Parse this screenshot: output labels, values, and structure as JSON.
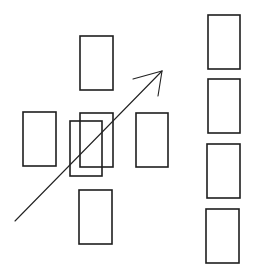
{
  "diagram": {
    "background": "#ffffff",
    "stroke_color": "#1e1e1e",
    "cluster": {
      "rects": [
        {
          "id": "top",
          "x": 80,
          "y": 36,
          "w": 33,
          "h": 54
        },
        {
          "id": "left",
          "x": 23,
          "y": 112,
          "w": 33,
          "h": 54
        },
        {
          "id": "center",
          "x": 80,
          "y": 113,
          "w": 33,
          "h": 54
        },
        {
          "id": "center-offset",
          "x": 70,
          "y": 121,
          "w": 32,
          "h": 55
        },
        {
          "id": "right",
          "x": 136,
          "y": 113,
          "w": 32,
          "h": 54
        },
        {
          "id": "bottom",
          "x": 79,
          "y": 190,
          "w": 33,
          "h": 54
        }
      ]
    },
    "column": {
      "rects": [
        {
          "id": "col-1",
          "x": 208,
          "y": 15,
          "w": 32,
          "h": 54
        },
        {
          "id": "col-2",
          "x": 208,
          "y": 79,
          "w": 32,
          "h": 54
        },
        {
          "id": "col-3",
          "x": 207,
          "y": 144,
          "w": 33,
          "h": 54
        },
        {
          "id": "col-4",
          "x": 206,
          "y": 209,
          "w": 33,
          "h": 54
        }
      ]
    },
    "arrow": {
      "x1": 15,
      "y1": 221,
      "x2": 162,
      "y2": 71,
      "head_left": {
        "x": 133,
        "y": 79
      },
      "head_right": {
        "x": 158,
        "y": 96
      }
    }
  }
}
